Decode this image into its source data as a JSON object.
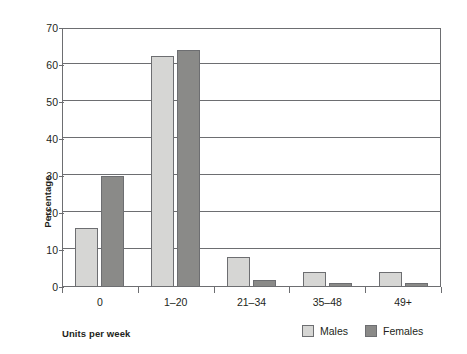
{
  "chart_data": {
    "type": "bar",
    "title": "",
    "xlabel": "Units per week",
    "ylabel": "Percentage",
    "categories": [
      "0",
      "1–20",
      "21–34",
      "35–48",
      "49+"
    ],
    "series": [
      {
        "name": "Males",
        "color": "#d6d6d4",
        "values": [
          16,
          62.5,
          8,
          4,
          4
        ]
      },
      {
        "name": "Females",
        "color": "#8a8a88",
        "values": [
          30,
          64,
          2,
          1,
          1
        ]
      }
    ],
    "ylim": [
      0,
      70
    ],
    "yticks": [
      0,
      10,
      20,
      30,
      40,
      50,
      60,
      70
    ],
    "ytick_labels": [
      "0",
      "10",
      "20",
      "30",
      "40",
      "50",
      "60",
      "70"
    ],
    "grid": "horizontal",
    "legend_position": "bottom-right",
    "legend": [
      "Males",
      "Females"
    ]
  },
  "colors": {
    "males": "#d6d6d4",
    "females": "#8a8a88",
    "axis": "#6d6e71",
    "text": "#231f20",
    "background": "#ffffff"
  }
}
